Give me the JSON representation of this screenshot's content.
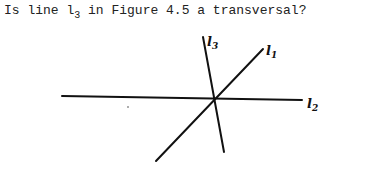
{
  "question": {
    "prefix": "Is line l",
    "subscript": "3",
    "suffix": " in Figure 4.5 a transversal?"
  },
  "figure": {
    "lines": [
      {
        "id": "l1",
        "label": "l",
        "label_sub": "1"
      },
      {
        "id": "l2",
        "label": "l",
        "label_sub": "2"
      },
      {
        "id": "l3",
        "label": "l",
        "label_sub": "3"
      }
    ],
    "stroke_color": "#111111"
  }
}
